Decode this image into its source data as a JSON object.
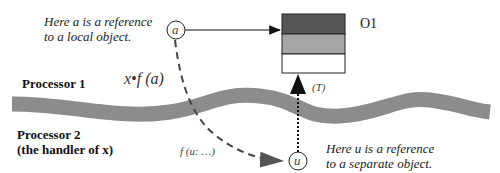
{
  "diagram": {
    "notes": {
      "local_line1": "Here a is a reference",
      "local_line2": "to a local object.",
      "separate_line1": "Here u is a reference",
      "separate_line2": "to a separate object."
    },
    "processors": {
      "p1": "Processor 1",
      "p2_line1": "Processor 2",
      "p2_line2": "(the handler of x)"
    },
    "nodes": {
      "a": "a",
      "u": "u",
      "object": "O1",
      "type_label": "(T)"
    },
    "calls": {
      "call_expr": "x•f (a)",
      "formal": "f (u: …)"
    },
    "colors": {
      "band": "#8c8c8c",
      "object_top": "#555555",
      "object_mid": "#a6a6a6",
      "object_bottom": "#ffffff",
      "lines": "#222222"
    }
  }
}
